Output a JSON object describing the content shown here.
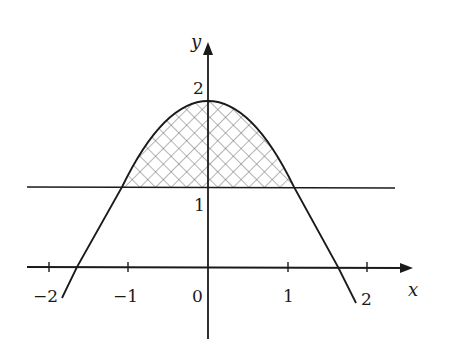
{
  "figure": {
    "axes": {
      "x_label": "x",
      "y_label": "y",
      "origin_label": "0",
      "x_ticks": [
        {
          "value": -2,
          "label": "−2"
        },
        {
          "value": -1,
          "label": "−1"
        },
        {
          "value": 1,
          "label": "1"
        },
        {
          "value": 2,
          "label": "2"
        }
      ],
      "y_ticks": [
        {
          "value": 1,
          "label": "1"
        },
        {
          "value": 2,
          "label": "2"
        }
      ]
    },
    "curves": [
      {
        "name": "bell-shaped curve",
        "description": "downward-opening curve with maximum near (0, 2), crossing x-axis near x = ±1.6"
      },
      {
        "name": "horizontal line",
        "equation": "y = 1"
      }
    ],
    "shaded_region": {
      "description": "region between curve and line y = 1",
      "pattern": "crosshatch",
      "x_range": [
        -1.07,
        1.07
      ]
    },
    "colors": {
      "ink": "#1a1a1a",
      "hatch": "#6a6a6a",
      "background": "#ffffff"
    }
  }
}
